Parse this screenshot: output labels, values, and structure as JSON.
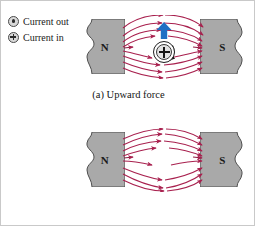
{
  "figure": {
    "legend": {
      "name": "current-direction-legend",
      "items": [
        {
          "symbol": "circle-dot-icon",
          "label": "Current out"
        },
        {
          "symbol": "circle-cross-icon",
          "label": "Current in"
        }
      ]
    },
    "colors": {
      "field_line": "#A8204E",
      "field_line_dark": "#8E1B42",
      "magnet_fill": "#A9A9A9",
      "magnet_stroke": "#4f4f4f",
      "force_arrow": "#1F6FC4",
      "text": "#141414"
    },
    "panels": [
      {
        "id": "panel-a",
        "caption": "(a)  Upward force",
        "caption_index": "(a)",
        "caption_text": "Upward force",
        "magnet_left_label": "N",
        "magnet_right_label": "S",
        "current_symbol": "circle-cross-icon",
        "current_direction": "Current in",
        "force_direction": "up",
        "field_direction": "left-to-right"
      },
      {
        "id": "panel-b",
        "caption": "(b)  Downward force",
        "caption_index": "(b)",
        "caption_text": "Downward force",
        "magnet_left_label": "N",
        "magnet_right_label": "S",
        "current_symbol": "circle-dot-icon",
        "current_direction": "Current out",
        "force_direction": "down",
        "field_direction": "left-to-right"
      }
    ]
  }
}
